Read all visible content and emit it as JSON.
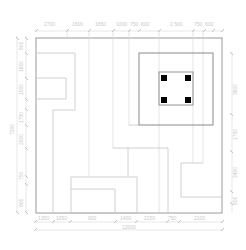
{
  "drawing": {
    "type": "floor-plan-dimension-drawing",
    "top_dimensions": [
      "2700",
      "1600",
      "1650",
      "1000",
      "750",
      "600",
      "2 500",
      "750",
      "600"
    ],
    "left_dimensions": [
      "600",
      "1600",
      "1000",
      "1750",
      "2000",
      "750",
      "900"
    ],
    "left_total": "7200",
    "right_dimensions": [
      "3600",
      "1750",
      "2400",
      "600"
    ],
    "bottom_dimensions": [
      "1350",
      "1050",
      "900",
      "1400",
      "2150",
      "750",
      "2100"
    ],
    "bottom_total": "12000",
    "colors": {
      "outline": "#9a9a9a",
      "inner_lines": "#c4c4c4",
      "dimension_lines": "#d6d6d6",
      "columns": "#000000",
      "background": "#ffffff"
    }
  }
}
